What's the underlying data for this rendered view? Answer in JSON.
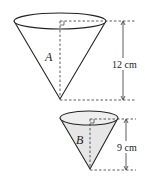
{
  "cone_a": {
    "label": "A",
    "height_label": "12 cm"
  },
  "cone_b": {
    "label": "B",
    "height_label": "9 cm"
  },
  "colors": {
    "stroke": "#222222",
    "fill_b": "#e6e6e6"
  }
}
